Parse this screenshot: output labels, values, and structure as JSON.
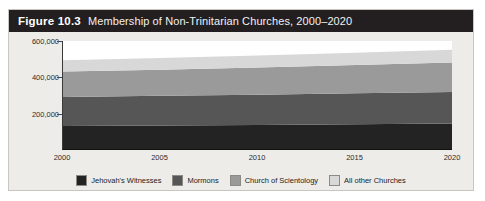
{
  "figure": {
    "number": "Figure 10.3",
    "title": "Membership of Non-Trinitarian Churches, 2000–2020"
  },
  "chart_data": {
    "type": "area",
    "title": "Membership of Non-Trinitarian Churches, 2000–2020",
    "xlabel": "",
    "ylabel": "",
    "x": [
      2000,
      2005,
      2010,
      2015,
      2020
    ],
    "xtick_labels": [
      "2000",
      "2005",
      "2010",
      "2015",
      "2020"
    ],
    "xlim": [
      2000,
      2020
    ],
    "ylim": [
      0,
      600000
    ],
    "ytick_values": [
      200000,
      400000,
      600000
    ],
    "ytick_labels": [
      "200,000",
      "400,000",
      "600,000"
    ],
    "grid": false,
    "stacked": true,
    "legend_position": "bottom",
    "series": [
      {
        "name": "Jehovah's Witnesses",
        "color": "#232323",
        "values": [
          132000,
          135000,
          138000,
          142000,
          146000
        ]
      },
      {
        "name": "Mormons",
        "color": "#565656",
        "values": [
          160000,
          163000,
          166000,
          170000,
          174000
        ]
      },
      {
        "name": "Church of Scientology",
        "color": "#9a9a9a",
        "values": [
          140000,
          144000,
          150000,
          156000,
          162000
        ]
      },
      {
        "name": "All other Churches",
        "color": "#d8d8d8",
        "values": [
          62000,
          64000,
          66000,
          68000,
          70000
        ]
      }
    ]
  },
  "legend": {
    "items": [
      {
        "label": "Jehovah's Witnesses",
        "color": "#232323"
      },
      {
        "label": "Mormons",
        "color": "#565656"
      },
      {
        "label": "Church of Scientology",
        "color": "#9a9a9a"
      },
      {
        "label": "All other Churches",
        "color": "#d8d8d8"
      }
    ]
  },
  "colors": {
    "title_bar": "#231f20",
    "card_background": "#eeece9",
    "plot_background": "#ffffff",
    "axis": "#111111"
  }
}
